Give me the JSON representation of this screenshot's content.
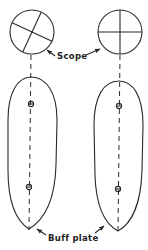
{
  "diagram": {
    "labels": {
      "scope": "Scope",
      "buff_plate": "Buff plate"
    },
    "scopes": [
      {
        "id": "left",
        "crosshair": "rotated"
      },
      {
        "id": "right",
        "crosshair": "aligned"
      }
    ],
    "plates": [
      {
        "id": "left",
        "markers": 2
      },
      {
        "id": "right",
        "markers": 2
      }
    ],
    "colors": {
      "line": "#2a2a2a",
      "background": "#ffffff"
    }
  }
}
